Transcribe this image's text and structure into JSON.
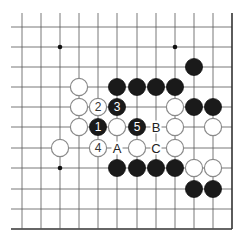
{
  "diagram": {
    "type": "go-board-fragment",
    "grid": {
      "columns_x": [
        22,
        41,
        60,
        79,
        98,
        117,
        137,
        156,
        175,
        194,
        213,
        232
      ],
      "rows_y": [
        27,
        47,
        67,
        87,
        107,
        127,
        148,
        168,
        189,
        209,
        229
      ],
      "top_extend_to": 13,
      "left_extend_to": 11,
      "right_edge": true,
      "bottom_edge": true,
      "line_color": "#555555",
      "edge_color": "#333333"
    },
    "hoshi": [
      {
        "col": 2,
        "row": 1
      },
      {
        "col": 8,
        "row": 1
      },
      {
        "col": 2,
        "row": 7
      }
    ],
    "stones": [
      {
        "col": 9,
        "row": 2,
        "color": "black"
      },
      {
        "col": 3,
        "row": 3,
        "color": "white"
      },
      {
        "col": 5,
        "row": 3,
        "color": "black"
      },
      {
        "col": 6,
        "row": 3,
        "color": "black"
      },
      {
        "col": 7,
        "row": 3,
        "color": "black"
      },
      {
        "col": 8,
        "row": 3,
        "color": "black"
      },
      {
        "col": 3,
        "row": 4,
        "color": "white"
      },
      {
        "col": 4,
        "row": 4,
        "color": "white",
        "label": "2"
      },
      {
        "col": 5,
        "row": 4,
        "color": "black",
        "label": "3"
      },
      {
        "col": 8,
        "row": 4,
        "color": "white"
      },
      {
        "col": 9,
        "row": 4,
        "color": "black"
      },
      {
        "col": 10,
        "row": 4,
        "color": "black"
      },
      {
        "col": 3,
        "row": 5,
        "color": "white"
      },
      {
        "col": 4,
        "row": 5,
        "color": "black",
        "label": "1"
      },
      {
        "col": 5,
        "row": 5,
        "color": "white"
      },
      {
        "col": 6,
        "row": 5,
        "color": "black",
        "label": "5"
      },
      {
        "col": 8,
        "row": 5,
        "color": "white"
      },
      {
        "col": 10,
        "row": 5,
        "color": "white"
      },
      {
        "col": 2,
        "row": 6,
        "color": "white"
      },
      {
        "col": 4,
        "row": 6,
        "color": "white",
        "label": "4"
      },
      {
        "col": 6,
        "row": 6,
        "color": "white"
      },
      {
        "col": 8,
        "row": 6,
        "color": "white"
      },
      {
        "col": 5,
        "row": 7,
        "color": "black"
      },
      {
        "col": 6,
        "row": 7,
        "color": "black"
      },
      {
        "col": 7,
        "row": 7,
        "color": "black"
      },
      {
        "col": 8,
        "row": 7,
        "color": "black"
      },
      {
        "col": 9,
        "row": 7,
        "color": "white"
      },
      {
        "col": 10,
        "row": 7,
        "color": "white"
      },
      {
        "col": 9,
        "row": 8,
        "color": "black"
      },
      {
        "col": 10,
        "row": 8,
        "color": "black"
      }
    ],
    "point_labels": [
      {
        "col": 7,
        "row": 5,
        "text": "B"
      },
      {
        "col": 5,
        "row": 6,
        "text": "A"
      },
      {
        "col": 7,
        "row": 6,
        "text": "C"
      }
    ],
    "colors": {
      "black_stone": "#1a1a1a",
      "white_stone_fill": "#ffffff",
      "white_stone_stroke": "#8a8a8a",
      "label_on_black": "#ffffff",
      "label_on_white": "#333333",
      "hoshi": "#111111"
    }
  }
}
